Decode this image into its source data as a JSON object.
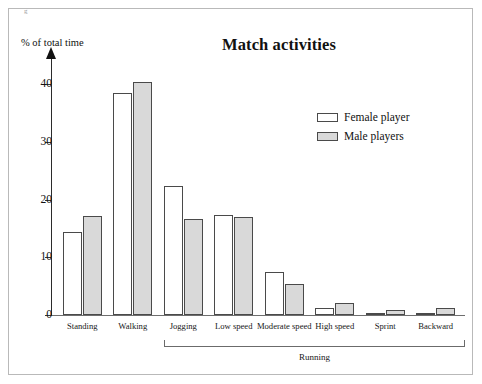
{
  "figure": {
    "corner_mark": "g",
    "title": "Match activities",
    "y_axis_title": "% of total time",
    "group_bracket_label": "Running"
  },
  "legend": {
    "position": "top-right",
    "entries": [
      {
        "label": "Female player",
        "swatch": "white-rect-icon",
        "color": "#ffffff"
      },
      {
        "label": "Male players",
        "swatch": "gray-rect-icon",
        "color": "#d9d9d9"
      }
    ]
  },
  "chart_data": {
    "type": "bar",
    "title": "Match activities",
    "xlabel": "",
    "ylabel": "% of total time",
    "ylim": [
      0,
      44
    ],
    "yticks": [
      0,
      10,
      20,
      30,
      40
    ],
    "ytick_labels": [
      "0",
      "10",
      "20",
      "30",
      "40"
    ],
    "grid": false,
    "legend_position": "top-right",
    "categories": [
      "Standing",
      "Walking",
      "Jogging",
      "Low speed",
      "Moderate speed",
      "High speed",
      "Sprint",
      "Backward"
    ],
    "group_bracket": {
      "label": "Running",
      "covers": [
        "Jogging",
        "Low speed",
        "Moderate speed",
        "High speed",
        "Sprint",
        "Backward"
      ]
    },
    "series": [
      {
        "name": "Female player",
        "color": "#ffffff",
        "values": [
          14.3,
          38.4,
          22.3,
          17.3,
          7.5,
          1.2,
          0.3,
          0.3
        ]
      },
      {
        "name": "Male players",
        "color": "#d9d9d9",
        "values": [
          17.1,
          40.3,
          16.7,
          17.0,
          5.4,
          2.0,
          0.8,
          1.3
        ]
      }
    ]
  }
}
